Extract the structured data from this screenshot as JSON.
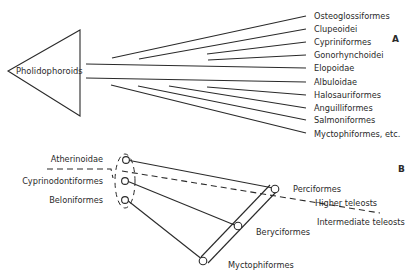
{
  "panel_a": {
    "label": "A",
    "root": "Pholidophoroids",
    "taxa": [
      "Osteoglossiformes",
      "Clupeoidei",
      "Cypriniformes",
      "Gonorhynchoidei",
      "Elopoidae",
      "Albuloidae",
      "Halosauriformes",
      "Anguilliformes",
      "Salmoniformes",
      "Myctophiformes, etc."
    ]
  },
  "panel_b": {
    "label": "B",
    "left_taxa": [
      "Atherinoidae",
      "Cyprinodontiformes",
      "Beloniformes"
    ],
    "nodes": [
      "Perciformes",
      "Beryciformes",
      "Myctophiformes"
    ],
    "grade_labels": {
      "upper": "Higher teleosts",
      "lower": "Intermediate teleosts"
    }
  },
  "colors": {
    "ink": "#2a2a2a",
    "background": "#ffffff"
  }
}
